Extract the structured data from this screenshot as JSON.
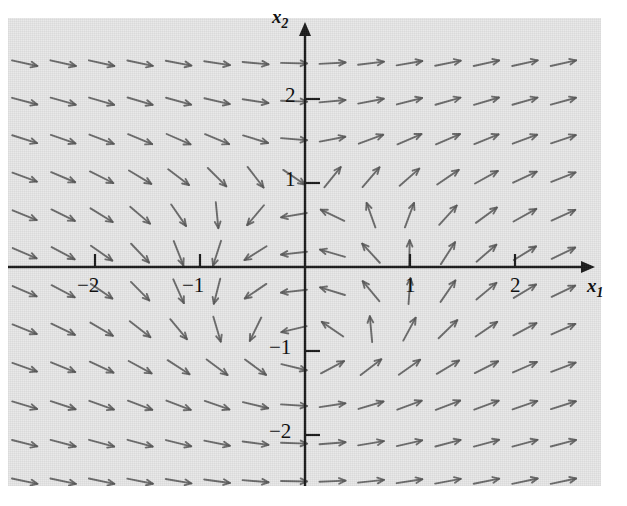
{
  "figure": {
    "kind": "direction-field",
    "background_color": "#e8e8e8",
    "ink_color": "#1a1a1a",
    "arrow_color": "#555555",
    "plot_left": 8,
    "plot_top": 18,
    "plot_width": 593,
    "plot_height": 468
  },
  "axes": {
    "x_axis_name": "x",
    "x_axis_sub": "1",
    "y_axis_name": "x",
    "y_axis_sub": "2",
    "origin_px": {
      "x": 297,
      "y": 249
    },
    "px_per_unit_x": 105,
    "px_per_unit_y": 84,
    "x_ticks": [
      {
        "value": -2,
        "label": "−2"
      },
      {
        "value": -1,
        "label": "−1"
      },
      {
        "value": 1,
        "label": "1"
      },
      {
        "value": 2,
        "label": "2"
      }
    ],
    "y_ticks": [
      {
        "value": 2,
        "label": "2"
      },
      {
        "value": 1,
        "label": "1"
      },
      {
        "value": -1,
        "label": "−1"
      },
      {
        "value": -2,
        "label": "−2"
      }
    ],
    "xlim": [
      -2.83,
      2.81
    ],
    "ylim": [
      -2.76,
      2.96
    ]
  },
  "chart_data": {
    "type": "scatter",
    "title": "",
    "xlabel": "x1",
    "ylabel": "x2",
    "xlim": [
      -2.83,
      2.81
    ],
    "ylim": [
      -2.76,
      2.96
    ],
    "grid": false,
    "legend": "none",
    "tick_labels_x": [
      "−2",
      "−1",
      "1",
      "2"
    ],
    "tick_labels_y": [
      "2",
      "1",
      "−1",
      "−2"
    ],
    "field": {
      "description": "Direction field of a planar autonomous system; arrows normalized to fixed length",
      "dx_formula": "x1*x1 + x2*x2 - 1",
      "dy_formula": "x1",
      "grid_nx": 15,
      "grid_ny": 12,
      "x_start": -2.67,
      "x_step": 0.3665,
      "y_start": -2.55,
      "y_step": 0.4524,
      "arrow_length_px": 26,
      "arrow_head_px": 7
    }
  }
}
